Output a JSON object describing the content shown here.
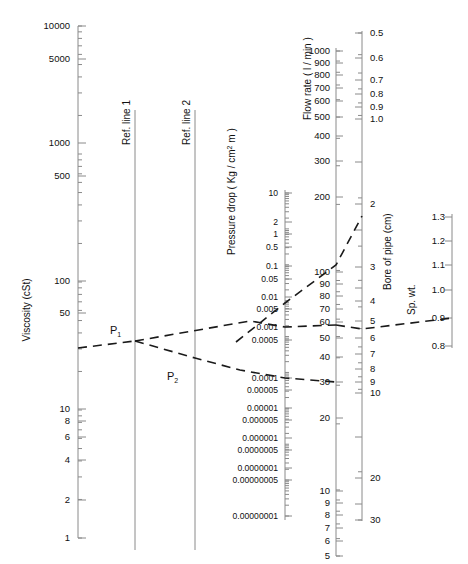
{
  "chart_data": {
    "type": "line",
    "subtitle": "",
    "grid": false,
    "legend_position": "none",
    "annotations": [
      "P1",
      "P2",
      "Ref. line 1",
      "Ref. line 2"
    ],
    "axes": [
      {
        "name": "viscosity",
        "label": "Viscosity (cSt)",
        "unit": "cSt",
        "scale": "log",
        "orientation": "vertical",
        "range": [
          1,
          10000
        ],
        "major_ticks": [
          10000,
          5000,
          1000,
          500,
          100,
          50,
          10,
          8,
          6,
          4,
          2,
          1
        ],
        "tick_labels": [
          "10000",
          "5000",
          "1000",
          "500",
          "100",
          "50",
          "10",
          "8",
          "6",
          "4",
          "2",
          "1"
        ]
      },
      {
        "name": "pressure-drop",
        "label": "Pressure drop ( Kg / cm2 m )",
        "label_base": "Pressure drop ( Kg / cm",
        "label_sup": "2",
        "label_tail": " m )",
        "scale": "log",
        "orientation": "vertical",
        "range": [
          1e-08,
          10
        ],
        "tick_labels": [
          "10",
          "2",
          "1",
          "0.5",
          "0.1",
          "0.05",
          "0.01",
          "0.005",
          "0.001",
          "0.0005",
          "0.0001",
          "0.00005",
          "0.00001",
          "0.000005",
          "0.000001",
          "0.0000005",
          "0.0000001",
          "0.00000005",
          "0.00000001"
        ]
      },
      {
        "name": "flow-rate",
        "label": "Flow rate ( l / min )",
        "unit": "l / min",
        "scale": "log",
        "orientation": "vertical",
        "range": [
          5,
          1000
        ],
        "tick_labels": [
          "1000",
          "900",
          "800",
          "700",
          "600",
          "500",
          "400",
          "300",
          "200",
          "100",
          "90",
          "80",
          "70",
          "60",
          "50",
          "40",
          "30",
          "20",
          "10",
          "9",
          "8",
          "7",
          "6",
          "5"
        ]
      },
      {
        "name": "bore-of-pipe",
        "label": "Bore of pipe (cm)",
        "unit": "cm",
        "scale": "log",
        "orientation": "vertical",
        "range": [
          0.5,
          30
        ],
        "tick_labels": [
          "0.5",
          "0.6",
          "0.7",
          "0.8",
          "0.9",
          "1.0",
          "2",
          "3",
          "4",
          "5",
          "6",
          "7",
          "8",
          "9",
          "10",
          "20",
          "30"
        ]
      },
      {
        "name": "specific-weight",
        "label": "Sp. wt.",
        "unit": "",
        "scale": "linear",
        "orientation": "vertical",
        "range": [
          0.8,
          1.3
        ],
        "tick_labels": [
          "1.3",
          "1.2",
          "1.1",
          "1.0",
          "0.9",
          "0.8"
        ]
      }
    ],
    "reference_lines": [
      {
        "name": "Ref. line 1"
      },
      {
        "name": "Ref. line 2"
      }
    ],
    "construction_points": [
      {
        "name": "P1",
        "on": "Ref. line 1"
      },
      {
        "name": "P2",
        "on": "Ref. line 2"
      }
    ],
    "series": [
      {
        "name": "line-viscosity-to-flow",
        "description": "Viscosity through P1 and P2 to pressure drop / flow rate",
        "points": [
          {
            "axis": "viscosity",
            "value": 35
          },
          {
            "axis": "ref-line-1",
            "value": "P1"
          },
          {
            "axis": "pressure-drop",
            "value": 0.001
          },
          {
            "axis": "flow-rate",
            "value": 55
          }
        ]
      },
      {
        "name": "line-through-P2",
        "description": "Branch through P2 to 0.0001 pressure drop and 30 l/min",
        "points": [
          {
            "axis": "ref-line-1",
            "value": "P1"
          },
          {
            "axis": "ref-line-2",
            "value": "P2"
          },
          {
            "axis": "pressure-drop",
            "value": 0.0001
          },
          {
            "axis": "flow-rate",
            "value": 30
          }
        ]
      },
      {
        "name": "line-flow-to-bore",
        "description": "Pressure-drop scale up to bore of pipe",
        "points": [
          {
            "axis": "pressure-drop",
            "value": 0.005
          },
          {
            "axis": "flow-rate",
            "value": 150
          },
          {
            "axis": "bore-of-pipe",
            "value": 2.4
          }
        ]
      },
      {
        "name": "line-bore-to-spwt",
        "description": "Flow rate through bore of pipe to specific weight",
        "points": [
          {
            "axis": "flow-rate",
            "value": 57
          },
          {
            "axis": "bore-of-pipe",
            "value": 5.6
          },
          {
            "axis": "specific-weight",
            "value": 0.9
          }
        ]
      }
    ]
  },
  "labels": {
    "viscosity_title": "Viscosity (cSt)",
    "pressure_title_base": "Pressure drop ( Kg / cm",
    "pressure_title_sup": "2",
    "pressure_title_tail": " m )",
    "flow_title": "Flow rate ( l / min )",
    "bore_title": "Bore of pipe (cm)",
    "spwt_title": "Sp. wt.",
    "ref_line_1": "Ref. line 1",
    "ref_line_2": "Ref. line 2",
    "p1_base": "P",
    "p1_sub": "1",
    "p2_base": "P",
    "p2_sub": "2"
  },
  "viscosity_ticks": [
    {
      "label": "10000",
      "y": 26
    },
    {
      "label": "5000",
      "y": 59
    },
    {
      "label": "1000",
      "y": 143
    },
    {
      "label": "500",
      "y": 176
    },
    {
      "label": "100",
      "y": 281
    },
    {
      "label": "50",
      "y": 313
    },
    {
      "label": "10",
      "y": 409
    },
    {
      "label": "8",
      "y": 421
    },
    {
      "label": "6",
      "y": 437
    },
    {
      "label": "4",
      "y": 460
    },
    {
      "label": "2",
      "y": 500
    },
    {
      "label": "1",
      "y": 538
    }
  ],
  "pressure_ticks": [
    {
      "label": "10",
      "y": 193
    },
    {
      "label": "2",
      "y": 222
    },
    {
      "label": "1",
      "y": 234
    },
    {
      "label": "0.5",
      "y": 247
    },
    {
      "label": "0.1",
      "y": 266
    },
    {
      "label": "0.05",
      "y": 279
    },
    {
      "label": "0.01",
      "y": 297
    },
    {
      "label": "0.005",
      "y": 309
    },
    {
      "label": "0.001",
      "y": 327
    },
    {
      "label": "0.0005",
      "y": 340
    },
    {
      "label": "0.0001",
      "y": 378
    },
    {
      "label": "0.00005",
      "y": 390
    },
    {
      "label": "0.00001",
      "y": 408
    },
    {
      "label": "0.000005",
      "y": 420
    },
    {
      "label": "0.000001",
      "y": 438
    },
    {
      "label": "0.0000005",
      "y": 450
    },
    {
      "label": "0.0000001",
      "y": 468
    },
    {
      "label": "0.00000005",
      "y": 480
    },
    {
      "label": "0.00000001",
      "y": 516
    }
  ],
  "flow_ticks": [
    {
      "label": "1000",
      "y": 51
    },
    {
      "label": "900",
      "y": 63
    },
    {
      "label": "800",
      "y": 75
    },
    {
      "label": "700",
      "y": 88
    },
    {
      "label": "600",
      "y": 101
    },
    {
      "label": "500",
      "y": 117
    },
    {
      "label": "400",
      "y": 136
    },
    {
      "label": "300",
      "y": 161
    },
    {
      "label": "200",
      "y": 197
    },
    {
      "label": "100",
      "y": 272
    },
    {
      "label": "90",
      "y": 284
    },
    {
      "label": "80",
      "y": 296
    },
    {
      "label": "70",
      "y": 309
    },
    {
      "label": "60",
      "y": 322
    },
    {
      "label": "50",
      "y": 338
    },
    {
      "label": "40",
      "y": 357
    },
    {
      "label": "30",
      "y": 382
    },
    {
      "label": "20",
      "y": 418
    },
    {
      "label": "10",
      "y": 491
    },
    {
      "label": "9",
      "y": 503
    },
    {
      "label": "8",
      "y": 515
    },
    {
      "label": "7",
      "y": 528
    },
    {
      "label": "6",
      "y": 541
    },
    {
      "label": "5",
      "y": 556
    }
  ],
  "bore_ticks": [
    {
      "label": "0.5",
      "y": 33
    },
    {
      "label": "0.6",
      "y": 58
    },
    {
      "label": "0.7",
      "y": 80
    },
    {
      "label": "0.8",
      "y": 94
    },
    {
      "label": "0.9",
      "y": 107
    },
    {
      "label": "1.0",
      "y": 119
    },
    {
      "label": "",
      "y": 162
    },
    {
      "label": "2",
      "y": 204
    },
    {
      "label": "",
      "y": 230
    },
    {
      "label": "3",
      "y": 267
    },
    {
      "label": "",
      "y": 288
    },
    {
      "label": "4",
      "y": 301
    },
    {
      "label": "5",
      "y": 321
    },
    {
      "label": "6",
      "y": 338
    },
    {
      "label": "7",
      "y": 354
    },
    {
      "label": "8",
      "y": 369
    },
    {
      "label": "9",
      "y": 382
    },
    {
      "label": "10",
      "y": 393
    },
    {
      "label": "",
      "y": 437
    },
    {
      "label": "20",
      "y": 478
    },
    {
      "label": "",
      "y": 504
    },
    {
      "label": "30",
      "y": 520
    }
  ],
  "spwt_ticks": [
    {
      "label": "1.3",
      "y": 217
    },
    {
      "label": "1.2",
      "y": 241
    },
    {
      "label": "1.1",
      "y": 265
    },
    {
      "label": "1.0",
      "y": 290
    },
    {
      "label": "0.9",
      "y": 318
    },
    {
      "label": "0.8",
      "y": 346
    }
  ],
  "colors": {
    "axis": "#8a8a8a",
    "line": "#1a1a1a",
    "text": "#111111",
    "background": "#ffffff"
  }
}
